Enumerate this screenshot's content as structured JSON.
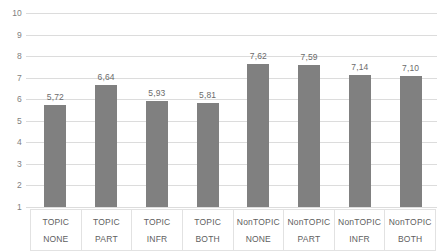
{
  "chart_data": {
    "type": "bar",
    "title": "",
    "xlabel": "",
    "ylabel": "",
    "ylim": [
      1,
      10
    ],
    "grid": true,
    "legend": "none",
    "decimal_separator": ",",
    "categories": [
      "TOPIC NONE",
      "TOPIC PART",
      "TOPIC INFR",
      "TOPIC BOTH",
      "NonTOPIC NONE",
      "NonTOPIC PART",
      "NonTOPIC INFR",
      "NonTOPIC BOTH"
    ],
    "category_lines": [
      {
        "top": "TOPIC",
        "bottom": "NONE"
      },
      {
        "top": "TOPIC",
        "bottom": "PART"
      },
      {
        "top": "TOPIC",
        "bottom": "INFR"
      },
      {
        "top": "TOPIC",
        "bottom": "BOTH"
      },
      {
        "top": "NonTOPIC",
        "bottom": "NONE"
      },
      {
        "top": "NonTOPIC",
        "bottom": "PART"
      },
      {
        "top": "NonTOPIC",
        "bottom": "INFR"
      },
      {
        "top": "NonTOPIC",
        "bottom": "BOTH"
      }
    ],
    "values": [
      5.72,
      6.64,
      5.93,
      5.81,
      7.62,
      7.59,
      7.14,
      7.1
    ],
    "value_labels": [
      "5,72",
      "6,64",
      "5,93",
      "5,81",
      "7,62",
      "7,59",
      "7,14",
      "7,10"
    ],
    "y_ticks": [
      10,
      9,
      8,
      7,
      6,
      5,
      4,
      3,
      2,
      1
    ],
    "y_tick_labels": [
      "10",
      "9",
      "8",
      "7",
      "6",
      "5",
      "4",
      "3",
      "2",
      "1"
    ],
    "colors": {
      "bar": "#808080",
      "gridline": "#dcdcdc",
      "tick_text": "#7f7f7f",
      "value_text": "#6b6b6b",
      "category_text": "#606060",
      "table_border": "#e2e2e2",
      "background": "#ffffff"
    }
  }
}
